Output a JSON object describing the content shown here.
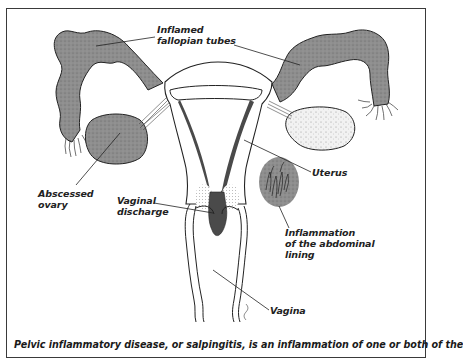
{
  "figure": {
    "labels": {
      "fallopian_tubes": [
        "Inflamed",
        "fallopian tubes"
      ],
      "uterus": "Uterus",
      "abscessed_ovary": [
        "Abscessed",
        "ovary"
      ],
      "vaginal_discharge": [
        "Vaginal",
        "discharge"
      ],
      "abdominal_lining": [
        "Inflammation",
        "of the abdominal",
        "lining"
      ],
      "vagina": "Vagina"
    },
    "caption": "Pelvic inflammatory disease, or salpingitis, is an inflammation of one or both of the",
    "colors": {
      "inflamed_tissue": "#8c8c8c",
      "discharge": "#4a4a4a",
      "outline": "#222222",
      "background": "#ffffff"
    }
  }
}
